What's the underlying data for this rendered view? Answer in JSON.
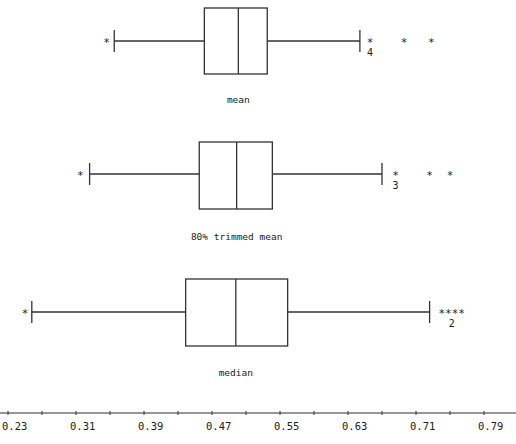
{
  "chart_data": {
    "type": "boxplot",
    "title": "",
    "xlabel": "",
    "ylabel": "",
    "orientation": "horizontal",
    "xlim": [
      0.22,
      0.815
    ],
    "x_ticks": [
      0.23,
      0.31,
      0.39,
      0.47,
      0.55,
      0.63,
      0.71,
      0.79
    ],
    "x_tick_labels": [
      "0.23",
      "0.31",
      "0.39",
      "0.47",
      "0.55",
      "0.63",
      "0.71",
      "0.79"
    ],
    "minor_tick_step": 0.04,
    "grid": false,
    "legend": null,
    "series": [
      {
        "name": "mean",
        "whisker_low": 0.355,
        "q1": 0.461,
        "median": 0.501,
        "q3": 0.535,
        "whisker_high": 0.644,
        "outliers_low": [
          0.346
        ],
        "outliers_high": [
          0.656,
          0.696,
          0.728
        ],
        "annotation": {
          "text": "4",
          "under_outlier": 0.656
        },
        "high_outlier_glyphs": [
          "*",
          "*",
          "*"
        ]
      },
      {
        "name": "80% trimmed mean",
        "whisker_low": 0.326,
        "q1": 0.455,
        "median": 0.499,
        "q3": 0.541,
        "whisker_high": 0.67,
        "outliers_low": [
          0.315
        ],
        "outliers_high": [
          0.686,
          0.726,
          0.75
        ],
        "annotation": {
          "text": "3",
          "under_outlier": 0.686
        },
        "high_outlier_glyphs": [
          "*",
          "*",
          "*"
        ]
      },
      {
        "name": "median",
        "whisker_low": 0.258,
        "q1": 0.439,
        "median": 0.498,
        "q3": 0.559,
        "whisker_high": 0.726,
        "outliers_low": [
          0.25
        ],
        "outliers_high": [
          0.752
        ],
        "annotation": {
          "text": "2",
          "under_outlier": 0.752
        },
        "high_outlier_glyphs": [
          "****"
        ]
      }
    ]
  },
  "layout": {
    "px_per_unit": 850,
    "origin_value": 0.23,
    "origin_px": 8,
    "axis_y": 413,
    "rows": [
      {
        "box_top": 8,
        "box_bottom": 74,
        "center": 41,
        "label_y": 103
      },
      {
        "box_top": 142,
        "box_bottom": 209,
        "center": 174,
        "label_y": 240
      },
      {
        "box_top": 279,
        "box_bottom": 346,
        "center": 312,
        "label_y": 376
      }
    ]
  },
  "colors": {
    "line": "#333333",
    "background": "#ffffff"
  }
}
